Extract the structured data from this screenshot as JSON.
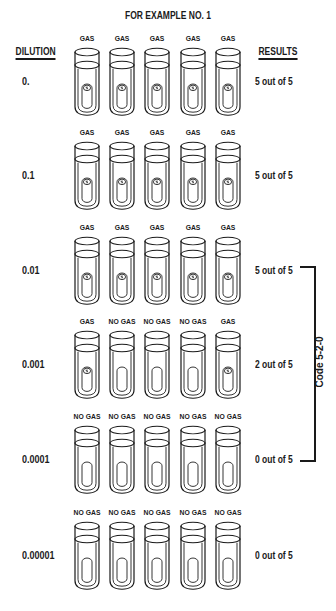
{
  "title": "FOR EXAMPLE NO. 1",
  "headers": {
    "dilution": "DILUTION",
    "results": "RESULTS"
  },
  "rows": [
    {
      "dilution": "0.",
      "result": "5 out of 5",
      "tubes": [
        "GAS",
        "GAS",
        "GAS",
        "GAS",
        "GAS"
      ]
    },
    {
      "dilution": "0.1",
      "result": "5 out of 5",
      "tubes": [
        "GAS",
        "GAS",
        "GAS",
        "GAS",
        "GAS"
      ]
    },
    {
      "dilution": "0.01",
      "result": "5 out of 5",
      "tubes": [
        "GAS",
        "GAS",
        "GAS",
        "GAS",
        "GAS"
      ]
    },
    {
      "dilution": "0.001",
      "result": "2 out of 5",
      "tubes": [
        "GAS",
        "NO GAS",
        "NO GAS",
        "NO GAS",
        "GAS"
      ]
    },
    {
      "dilution": "0.0001",
      "result": "0 out of 5",
      "tubes": [
        "NO GAS",
        "NO GAS",
        "NO GAS",
        "NO GAS",
        "NO GAS"
      ]
    },
    {
      "dilution": "0.00001",
      "result": "0 out of 5",
      "tubes": [
        "NO GAS",
        "NO GAS",
        "NO GAS",
        "NO GAS",
        "NO GAS"
      ]
    }
  ],
  "bracket": {
    "label": "Code 5-2-0",
    "spans_rows": [
      "0.01",
      "0.001",
      "0.0001"
    ]
  },
  "colors": {
    "ink": "#1a1a1a",
    "background": "#ffffff"
  }
}
